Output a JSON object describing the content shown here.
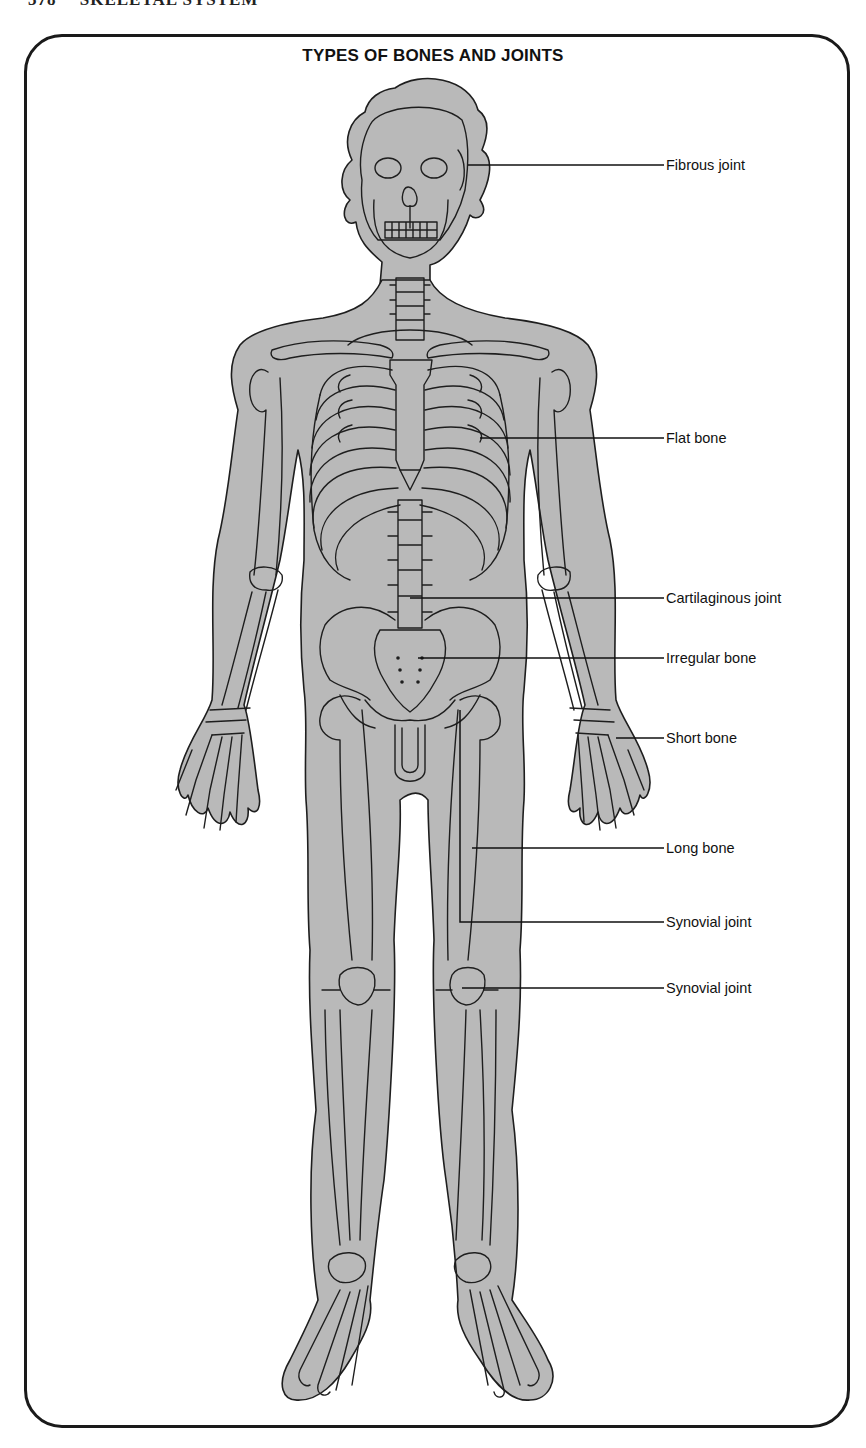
{
  "page": {
    "page_number": "378",
    "running_head": "SKELETAL SYSTEM"
  },
  "figure": {
    "title": "TYPES OF BONES AND JOINTS",
    "colors": {
      "body_fill": "#b9b9b9",
      "outline": "#1e1e1e",
      "frame": "#1a1a1a",
      "background": "#ffffff"
    },
    "labels": [
      {
        "id": "fibrous-joint",
        "text": "Fibrous joint",
        "y": 165,
        "line_from": [
          468,
          165
        ]
      },
      {
        "id": "flat-bone",
        "text": "Flat bone",
        "y": 438,
        "line_from": [
          480,
          438
        ]
      },
      {
        "id": "cartilaginous-joint",
        "text": "Cartilaginous joint",
        "y": 598,
        "line_from": [
          410,
          598
        ]
      },
      {
        "id": "irregular-bone",
        "text": "Irregular bone",
        "y": 658,
        "line_from": [
          418,
          658
        ]
      },
      {
        "id": "short-bone",
        "text": "Short bone",
        "y": 738,
        "line_from": [
          616,
          738
        ]
      },
      {
        "id": "long-bone",
        "text": "Long bone",
        "y": 848,
        "line_from": [
          472,
          848
        ]
      },
      {
        "id": "synovial-joint-hip",
        "text": "Synovial joint",
        "y": 922,
        "line_from": [
          460,
          710
        ]
      },
      {
        "id": "synovial-joint-knee",
        "text": "Synovial joint",
        "y": 988,
        "line_from": [
          462,
          988
        ]
      }
    ]
  }
}
